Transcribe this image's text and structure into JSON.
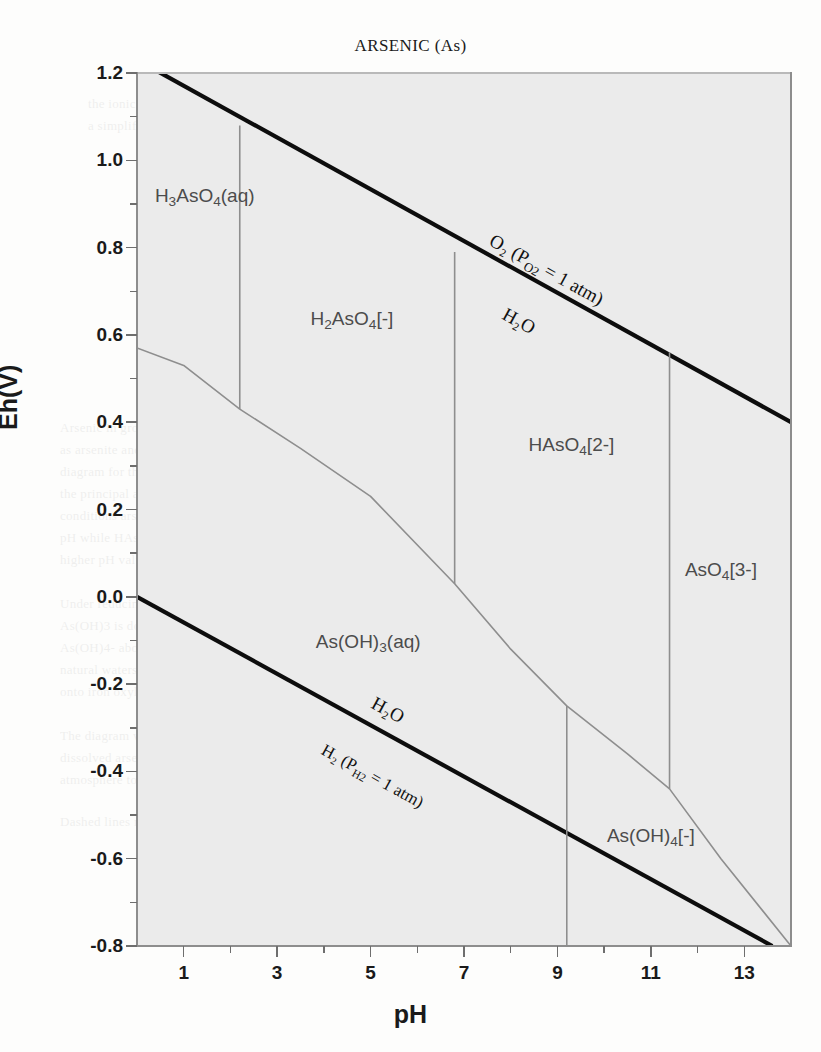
{
  "title": "ARSENIC (As)",
  "axes": {
    "x_title": "pH",
    "y_title": "Eh(V)",
    "x_major_labels": [
      "1",
      "3",
      "5",
      "7",
      "9",
      "11",
      "13"
    ],
    "y_major_labels": [
      "1.2",
      "1.0",
      "0.8",
      "0.6",
      "0.4",
      "0.2",
      "0.0",
      "-0.2",
      "-0.4",
      "-0.6",
      "-0.8"
    ]
  },
  "water_lines": {
    "upper_above": "O₂ (P<sub>O2</sub> = 1 atm)",
    "upper_below": "H₂O",
    "lower_above": "H₂O",
    "lower_below": "H₂ (P<sub>H2</sub> = 1 atm)"
  },
  "species_labels": {
    "h3aso4": "H<sub>3</sub>AsO<sub>4</sub>(aq)",
    "h2aso4": "H<sub>2</sub>AsO<sub>4</sub>[-]",
    "haso4": "HAsO<sub>4</sub>[2-]",
    "aso4": "AsO<sub>4</sub>[3-]",
    "asoh3": "As(OH)<sub>3</sub>(aq)",
    "asoh4": "As(OH)<sub>4</sub>[-]"
  },
  "bleed_text": [
    {
      "x": 88,
      "y": 96,
      "t": "the ionic strength of the solution and therefore"
    },
    {
      "x": 88,
      "y": 118,
      "t": "a simplified ) Laws and Farmulations"
    },
    {
      "x": 470,
      "y": 106,
      "t": "of the"
    },
    {
      "x": 60,
      "y": 420,
      "t": "Arsenic in groundwater occurs predominantly"
    },
    {
      "x": 60,
      "y": 442,
      "t": "as arsenite and arsenate species. The Eh-pH"
    },
    {
      "x": 60,
      "y": 464,
      "t": "diagram for the As-O-H system at 25 C shows"
    },
    {
      "x": 60,
      "y": 486,
      "t": "the principal aqueous species. Under oxidizing"
    },
    {
      "x": 60,
      "y": 508,
      "t": "conditions arsenate H2AsO4- dominates at low"
    },
    {
      "x": 60,
      "y": 530,
      "t": "pH while HAsO4 2- becomes the stable form at"
    },
    {
      "x": 60,
      "y": 552,
      "t": "higher pH values and AsO4 3- at very high pH."
    },
    {
      "x": 60,
      "y": 596,
      "t": "Under reducing conditions the arsenite species"
    },
    {
      "x": 60,
      "y": 618,
      "t": "As(OH)3 is dominant below about pH 9.2 and"
    },
    {
      "x": 60,
      "y": 640,
      "t": "As(OH)4- above it. The mobility of arsenic in"
    },
    {
      "x": 60,
      "y": 662,
      "t": "natural waters is strongly controlled by sorption"
    },
    {
      "x": 60,
      "y": 684,
      "t": "onto iron oxyhydroxides and clay minerals."
    },
    {
      "x": 60,
      "y": 728,
      "t": "The diagram was computed assuming a total"
    },
    {
      "x": 60,
      "y": 750,
      "t": "dissolved arsenic activity of 10-6 molal at one"
    },
    {
      "x": 60,
      "y": 772,
      "t": "atmosphere total pressure and 25 degrees C."
    },
    {
      "x": 60,
      "y": 814,
      "t": "Dashed lines mark the stability field of water."
    }
  ],
  "chart_data": {
    "type": "line",
    "title": "ARSENIC (As)",
    "subtitle": "Eh-pH (Pourbaix) diagram for the As-O-H system",
    "xlabel": "pH",
    "ylabel": "Eh(V)",
    "xlim": [
      0.0,
      14.0
    ],
    "ylim": [
      -0.8,
      1.2
    ],
    "x_major_ticks": [
      1,
      3,
      5,
      7,
      9,
      11,
      13
    ],
    "x_minor_ticks": [
      0,
      2,
      4,
      6,
      8,
      10,
      12,
      14
    ],
    "y_major_ticks": [
      1.2,
      1.0,
      0.8,
      0.6,
      0.4,
      0.2,
      0.0,
      -0.2,
      -0.4,
      -0.6,
      -0.8
    ],
    "y_minor_ticks": [
      1.1,
      0.9,
      0.7,
      0.5,
      0.3,
      0.1,
      -0.1,
      -0.3,
      -0.5,
      -0.7
    ],
    "grid": false,
    "legend": "none",
    "series": [
      {
        "name": "O2 / H2O upper water stability limit",
        "style": "thick-black",
        "points": [
          [
            0.0,
            1.23
          ],
          [
            14.0,
            0.4
          ]
        ]
      },
      {
        "name": "H2O / H2 lower water stability limit",
        "style": "thick-black",
        "points": [
          [
            0.0,
            0.0
          ],
          [
            13.6,
            -0.8
          ]
        ]
      },
      {
        "name": "As(V)/As(III) redox boundary",
        "style": "thin-gray",
        "points": [
          [
            0.0,
            0.57
          ],
          [
            1.0,
            0.53
          ],
          [
            2.2,
            0.43
          ],
          [
            3.5,
            0.34
          ],
          [
            5.0,
            0.23
          ],
          [
            6.8,
            0.03
          ],
          [
            8.0,
            -0.12
          ],
          [
            9.2,
            -0.25
          ],
          [
            10.5,
            -0.36
          ],
          [
            11.4,
            -0.44
          ],
          [
            12.5,
            -0.6
          ],
          [
            14.0,
            -0.8
          ]
        ]
      },
      {
        "name": "H3AsO4(aq) / H2AsO4[-] boundary (pKa1)",
        "style": "thin-gray-vertical",
        "points": [
          [
            2.2,
            1.08
          ],
          [
            2.2,
            0.43
          ]
        ]
      },
      {
        "name": "H2AsO4[-] / HAsO4[2-] boundary (pKa2)",
        "style": "thin-gray-vertical",
        "points": [
          [
            6.8,
            0.79
          ],
          [
            6.8,
            0.03
          ]
        ]
      },
      {
        "name": "HAsO4[2-] / AsO4[3-] boundary (pKa3)",
        "style": "thin-gray-vertical",
        "points": [
          [
            11.4,
            0.56
          ],
          [
            11.4,
            -0.44
          ]
        ]
      },
      {
        "name": "As(OH)3(aq) / As(OH)4[-] boundary",
        "style": "thin-gray-vertical",
        "points": [
          [
            9.2,
            -0.25
          ],
          [
            9.2,
            -0.8
          ]
        ]
      }
    ],
    "field_labels": [
      {
        "text": "H3AsO4(aq)",
        "pH": 1.45,
        "Eh": 0.915
      },
      {
        "text": "H2AsO4[-]",
        "pH": 4.6,
        "Eh": 0.635
      },
      {
        "text": "HAsO4[2-]",
        "pH": 9.3,
        "Eh": 0.345
      },
      {
        "text": "AsO4[3-]",
        "pH": 12.5,
        "Eh": 0.06
      },
      {
        "text": "As(OH)3(aq)",
        "pH": 4.95,
        "Eh": -0.105
      },
      {
        "text": "As(OH)4[-]",
        "pH": 11.0,
        "Eh": -0.55
      }
    ],
    "annotations": [
      {
        "text": "O2 (PO2 = 1 atm)",
        "pH": 7.6,
        "Eh": 0.82,
        "position": "above upper line"
      },
      {
        "text": "H2O",
        "pH": 7.9,
        "Eh": 0.67,
        "position": "below upper line"
      },
      {
        "text": "H2O",
        "pH": 5.2,
        "Eh": -0.225,
        "position": "above lower line"
      },
      {
        "text": "H2 (PH2 = 1 atm)",
        "pH": 4.1,
        "Eh": -0.335,
        "position": "below lower line"
      }
    ]
  }
}
